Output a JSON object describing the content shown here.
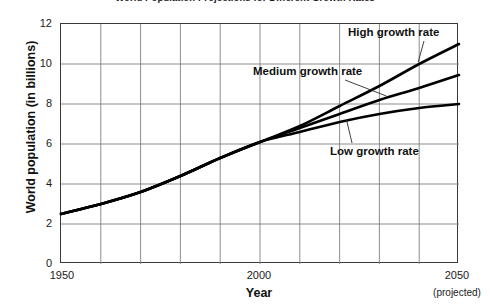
{
  "chart_data": {
    "type": "line",
    "title": "World Population Projections for Different Growth Rates",
    "xlabel": "Year",
    "ylabel": "World population (in billions)",
    "xlim": [
      1950,
      2050
    ],
    "ylim": [
      0,
      12
    ],
    "xticks": [
      "1950",
      "2000",
      "2050"
    ],
    "xtick_sublabel": "(projected)",
    "yticks": [
      "0",
      "2",
      "4",
      "6",
      "8",
      "10",
      "12"
    ],
    "grid": true,
    "grid_x_step": 10,
    "grid_y_step": 2,
    "legend_position": "inline-annotations",
    "x": [
      1950,
      1960,
      1970,
      1980,
      1990,
      2000,
      2010,
      2020,
      2030,
      2040,
      2050
    ],
    "series": [
      {
        "name": "High growth rate",
        "values": [
          2.5,
          3.0,
          3.6,
          4.4,
          5.3,
          6.1,
          6.9,
          7.9,
          8.9,
          10.0,
          11.0
        ]
      },
      {
        "name": "Medium growth rate",
        "values": [
          2.5,
          3.0,
          3.6,
          4.4,
          5.3,
          6.1,
          6.8,
          7.5,
          8.2,
          8.8,
          9.45
        ]
      },
      {
        "name": "Low growth rate",
        "values": [
          2.5,
          3.0,
          3.6,
          4.4,
          5.3,
          6.1,
          6.6,
          7.1,
          7.5,
          7.8,
          8.0
        ]
      }
    ],
    "annotations": [
      {
        "text": "High growth rate",
        "anchor_x": 2040,
        "anchor_y": 10.05
      },
      {
        "text": "Medium growth rate",
        "anchor_x": 2032,
        "anchor_y": 8.35
      },
      {
        "text": "Low growth rate",
        "anchor_x": 2022,
        "anchor_y": 7.15
      }
    ],
    "line_color": "#000000",
    "grid_color": "#808080",
    "frame_color": "#3a3a3a"
  }
}
